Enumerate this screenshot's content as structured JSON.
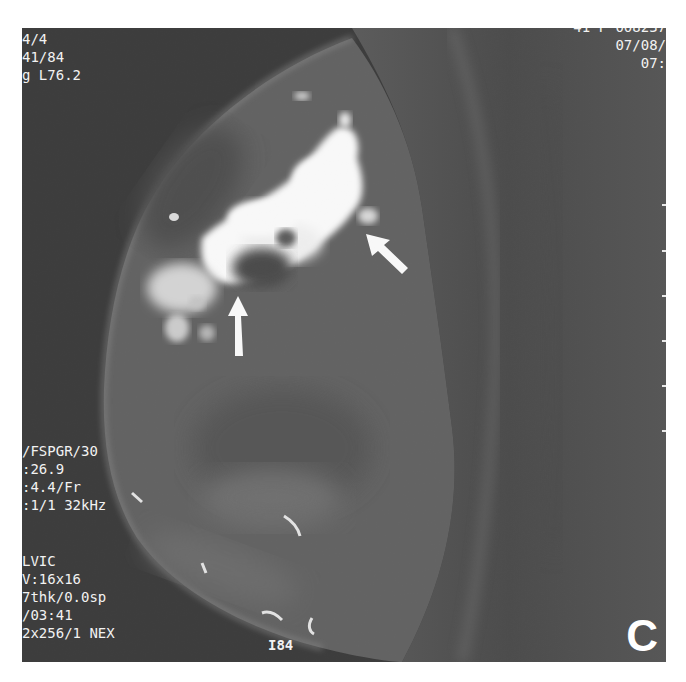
{
  "image": {
    "type": "breast MRI, sagittal, contrast-enhanced fat-suppressed",
    "panel_label": "C",
    "colors": {
      "background": "#3c3c3c",
      "tissue": "#6a6a6a",
      "enhancement": "#ffffff",
      "overlay_text": "#f2f2f2"
    }
  },
  "overlay": {
    "top_left": [
      "4/4",
      "41/84",
      "g L76.2"
    ],
    "top_right": [
      "41 F 008237",
      "07/08/",
      "07:"
    ],
    "bottom_left_block1": [
      "/FSPGR/30",
      ":26.9",
      ":4.4/Fr",
      ":1/1 32kHz"
    ],
    "bottom_left_block2": [
      "LVIC",
      "V:16x16",
      "7thk/0.0sp",
      "/03:41",
      "2x256/1 NEX"
    ],
    "bottom_center": "I84"
  },
  "annotations": {
    "arrows": [
      {
        "name": "vertical-arrow",
        "direction": "up",
        "points_to": "dark non-enhancing area below mass"
      },
      {
        "name": "diagonal-arrow",
        "direction": "up-left",
        "points_to": "posterior edge of enhancing mass"
      }
    ]
  }
}
